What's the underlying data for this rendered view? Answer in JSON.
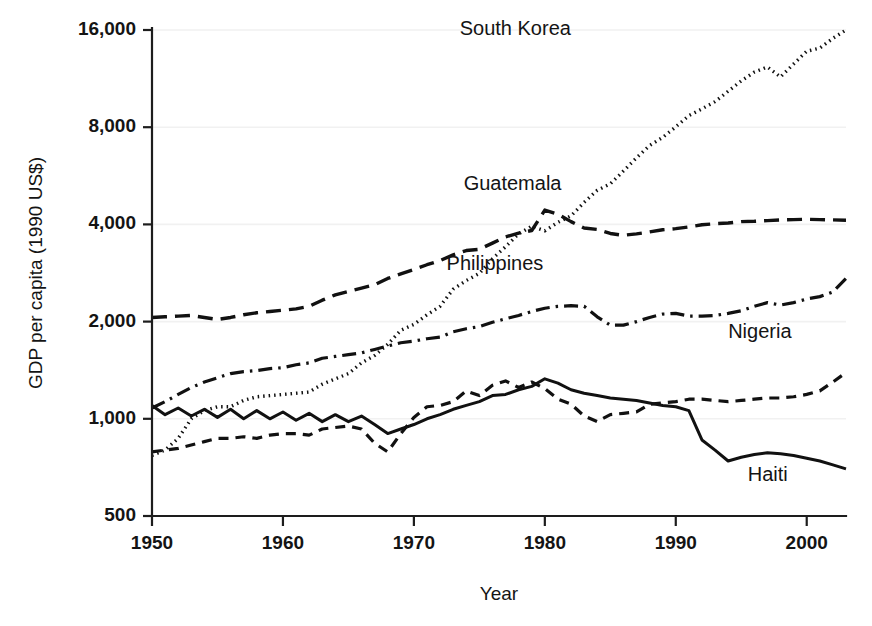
{
  "chart_data": {
    "type": "line",
    "title": "",
    "xlabel": "Year",
    "ylabel": "GDP per capita (1990 US$)",
    "yscale": "log",
    "ylim": [
      500,
      16000
    ],
    "xlim": [
      1950,
      2003
    ],
    "grid": true,
    "legend_position": "inline-right-of-series",
    "y_ticks": [
      500,
      1000,
      2000,
      4000,
      8000,
      16000
    ],
    "y_tick_labels": [
      "500",
      "1,000",
      "2,000",
      "4,000",
      "8,000",
      "16,000"
    ],
    "x_ticks": [
      1950,
      1960,
      1970,
      1980,
      1990,
      2000
    ],
    "x_tick_labels": [
      "1950",
      "1960",
      "1970",
      "1980",
      "1990",
      "2000"
    ],
    "x": [
      1950,
      1951,
      1952,
      1953,
      1954,
      1955,
      1956,
      1957,
      1958,
      1959,
      1960,
      1961,
      1962,
      1963,
      1964,
      1965,
      1966,
      1967,
      1968,
      1969,
      1970,
      1971,
      1972,
      1973,
      1974,
      1975,
      1976,
      1977,
      1978,
      1979,
      1980,
      1981,
      1982,
      1983,
      1984,
      1985,
      1986,
      1987,
      1988,
      1989,
      1990,
      1991,
      1992,
      1993,
      1994,
      1995,
      1996,
      1997,
      1998,
      1999,
      2000,
      2001,
      2002,
      2003
    ],
    "series": [
      {
        "name": "South Korea",
        "dash": "dotted",
        "label_x": 1973.5,
        "label_y": 15400,
        "values": [
          770,
          800,
          870,
          1000,
          1060,
          1090,
          1090,
          1140,
          1170,
          1180,
          1190,
          1200,
          1210,
          1280,
          1330,
          1380,
          1490,
          1570,
          1700,
          1880,
          1960,
          2100,
          2230,
          2520,
          2680,
          2820,
          3130,
          3410,
          3740,
          3950,
          3820,
          4060,
          4250,
          4680,
          5100,
          5340,
          5850,
          6430,
          7020,
          7440,
          8020,
          8690,
          9120,
          9600,
          10340,
          11130,
          11850,
          12290,
          11450,
          12560,
          13750,
          14060,
          15080,
          16000
        ]
      },
      {
        "name": "Guatemala",
        "dash": "dashed",
        "label_x": 1973.8,
        "label_y": 5100,
        "values": [
          2060,
          2070,
          2080,
          2090,
          2060,
          2030,
          2060,
          2100,
          2130,
          2150,
          2170,
          2190,
          2230,
          2330,
          2420,
          2480,
          2540,
          2600,
          2720,
          2810,
          2900,
          3000,
          3090,
          3220,
          3320,
          3350,
          3500,
          3660,
          3760,
          3830,
          4430,
          4300,
          4080,
          3900,
          3860,
          3750,
          3700,
          3740,
          3790,
          3850,
          3880,
          3930,
          3990,
          4020,
          4040,
          4080,
          4090,
          4110,
          4130,
          4140,
          4150,
          4140,
          4130,
          4120
        ]
      },
      {
        "name": "Philippines",
        "dash": "dashdot",
        "label_x": 1972.5,
        "label_y": 2880,
        "values": [
          1080,
          1130,
          1190,
          1250,
          1300,
          1340,
          1380,
          1400,
          1410,
          1430,
          1440,
          1470,
          1490,
          1540,
          1560,
          1580,
          1600,
          1640,
          1680,
          1720,
          1740,
          1770,
          1790,
          1860,
          1900,
          1930,
          1990,
          2040,
          2090,
          2150,
          2200,
          2230,
          2240,
          2230,
          2070,
          1950,
          1950,
          2000,
          2060,
          2110,
          2120,
          2080,
          2080,
          2090,
          2120,
          2160,
          2230,
          2290,
          2250,
          2290,
          2350,
          2390,
          2470,
          2720
        ]
      },
      {
        "name": "Nigeria",
        "dash": "dashed-short",
        "label_x": 1994.0,
        "label_y": 1780,
        "values": [
          790,
          800,
          810,
          830,
          850,
          870,
          870,
          880,
          870,
          890,
          900,
          900,
          890,
          930,
          940,
          950,
          930,
          840,
          790,
          900,
          1010,
          1090,
          1100,
          1130,
          1220,
          1180,
          1270,
          1310,
          1250,
          1300,
          1240,
          1150,
          1110,
          1020,
          980,
          1030,
          1040,
          1050,
          1110,
          1120,
          1130,
          1150,
          1150,
          1140,
          1130,
          1140,
          1150,
          1160,
          1160,
          1170,
          1190,
          1220,
          1300,
          1390
        ]
      },
      {
        "name": "Haiti",
        "dash": "solid",
        "label_x": 1995.5,
        "label_y": 640,
        "values": [
          1100,
          1030,
          1080,
          1020,
          1070,
          1010,
          1070,
          1000,
          1060,
          1000,
          1050,
          990,
          1040,
          980,
          1030,
          980,
          1020,
          960,
          900,
          930,
          960,
          1000,
          1030,
          1070,
          1100,
          1130,
          1180,
          1190,
          1230,
          1260,
          1330,
          1290,
          1230,
          1200,
          1180,
          1160,
          1150,
          1140,
          1120,
          1100,
          1090,
          1060,
          860,
          800,
          740,
          760,
          775,
          785,
          780,
          770,
          755,
          740,
          720,
          700
        ]
      }
    ]
  },
  "plot": {
    "left": 152,
    "right": 846,
    "top": 30,
    "bottom": 516
  }
}
